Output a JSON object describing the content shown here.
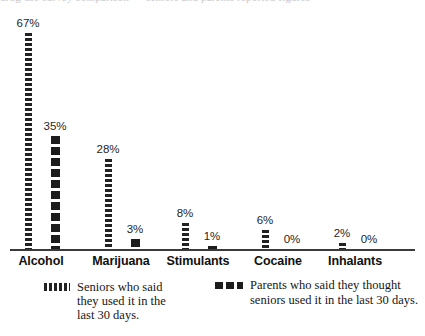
{
  "page": {
    "top_cut_text": "drug use survey comparison — seniors and parents reported figures",
    "background_color": "#ffffff",
    "ink_color": "#1c1c1c"
  },
  "chart_data": {
    "type": "bar",
    "title": "",
    "subtitle": "",
    "xlabel": "",
    "ylabel": "",
    "ylim": [
      0,
      70
    ],
    "grid": false,
    "legend_position": "bottom",
    "value_suffix": "%",
    "categories": [
      "Alcohol",
      "Marijuana",
      "Stimulants",
      "Cocaine",
      "Inhalants"
    ],
    "series": [
      {
        "name": "Seniors who said\nthey used it in the\nlast 30 days.",
        "short_name": "seniors",
        "style": "fine-dashed",
        "color": "#222222",
        "values": [
          67,
          28,
          8,
          6,
          2
        ],
        "labels": [
          "67%",
          "28%",
          "8%",
          "6%",
          "2%"
        ]
      },
      {
        "name": "Parents who said they thought\nseniors used it in the last 30 days.",
        "short_name": "parents",
        "style": "chunky-dashed",
        "color": "#1c1c1c",
        "values": [
          35,
          3,
          1,
          0,
          0
        ],
        "labels": [
          "35%",
          "3%",
          "1%",
          "0%",
          "0%"
        ]
      }
    ]
  },
  "legend": {
    "entries": [
      {
        "label": "Seniors who said\nthey used it in the\nlast 30 days.",
        "swatch": "fine-dashed-swatch"
      },
      {
        "label": "Parents who said they thought\nseniors used it in the last 30 days.",
        "swatch": "chunky-dashed-swatch"
      }
    ]
  }
}
